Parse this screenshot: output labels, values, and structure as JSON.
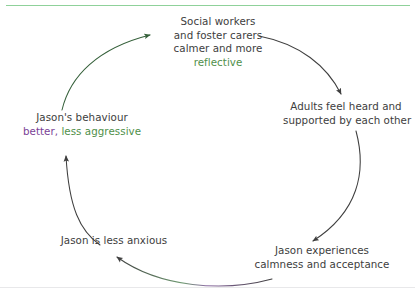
{
  "diagram": {
    "type": "virtuous-cycle",
    "title": "",
    "accent_color_green": "#4f8f4a",
    "accent_color_purple": "#7a3f96",
    "arrow_color": "#4a4a4a",
    "text_color": "#3d3d3d",
    "top_rule_color": "#8fd19a",
    "direction": "clockwise",
    "nodes": [
      {
        "id": "social-workers",
        "position": "top",
        "lines": [
          {
            "text": "Social workers",
            "emphasis": "none"
          },
          {
            "text": "and foster carers",
            "emphasis": "none"
          },
          {
            "text": "calmer and more",
            "emphasis": "none"
          },
          {
            "text": "reflective",
            "emphasis": "green"
          }
        ]
      },
      {
        "id": "adults-supported",
        "position": "right",
        "lines": [
          {
            "text": "Adults feel heard and",
            "emphasis": "none"
          },
          {
            "text": "supported by each other",
            "emphasis": "none"
          }
        ]
      },
      {
        "id": "jason-calmness",
        "position": "bottom-right",
        "lines": [
          {
            "text": "Jason experiences",
            "emphasis": "none"
          },
          {
            "text": "calmness and acceptance",
            "emphasis": "none"
          }
        ]
      },
      {
        "id": "jason-less-anxious",
        "position": "bottom-left",
        "lines": [
          {
            "text": "Jason is less anxious",
            "emphasis": "none"
          }
        ]
      },
      {
        "id": "jason-behaviour",
        "position": "left",
        "lines": [
          {
            "text": "Jason's behaviour",
            "emphasis": "none"
          },
          {
            "text": "better,",
            "emphasis": "purple"
          },
          {
            "text": "less aggressive",
            "emphasis": "green"
          }
        ]
      }
    ],
    "arrows": [
      {
        "id": "arrow-behaviour-to-social",
        "from": "jason-behaviour",
        "to": "social-workers"
      },
      {
        "id": "arrow-social-to-adults",
        "from": "social-workers",
        "to": "adults-supported"
      },
      {
        "id": "arrow-adults-to-calmness",
        "from": "adults-supported",
        "to": "jason-calmness"
      },
      {
        "id": "arrow-calmness-to-anxious",
        "from": "jason-calmness",
        "to": "jason-less-anxious"
      },
      {
        "id": "arrow-anxious-to-behaviour",
        "from": "jason-less-anxious",
        "to": "jason-behaviour"
      }
    ]
  }
}
